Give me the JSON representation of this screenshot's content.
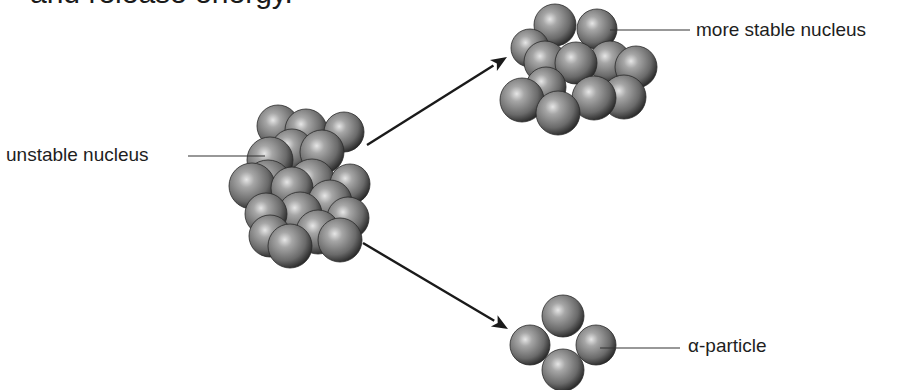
{
  "title": {
    "text": "and release energy.",
    "note": "clipped at top edge"
  },
  "labels": {
    "unstable": "unstable nucleus",
    "stable": "more stable nucleus",
    "alpha": "α-particle"
  },
  "colors": {
    "sphere_light": "#d8d8d8",
    "sphere_mid": "#8a8a8a",
    "sphere_dark": "#2e2e2e",
    "line": "#1a1a1a",
    "text": "#1e1e1e",
    "background": "#ffffff"
  },
  "nuclei": {
    "unstable": {
      "spheres": [
        [
          290,
          246,
          22
        ],
        [
          340,
          240,
          22
        ],
        [
          270,
          236,
          21
        ],
        [
          318,
          232,
          22
        ],
        [
          348,
          218,
          21
        ],
        [
          300,
          214,
          22
        ],
        [
          266,
          214,
          21
        ],
        [
          330,
          202,
          22
        ],
        [
          268,
          184,
          24
        ],
        [
          350,
          184,
          20
        ],
        [
          292,
          188,
          21
        ],
        [
          252,
          186,
          23
        ],
        [
          312,
          182,
          23
        ],
        [
          278,
          126,
          21
        ],
        [
          344,
          132,
          20
        ],
        [
          306,
          130,
          21
        ],
        [
          270,
          160,
          23
        ],
        [
          322,
          152,
          22
        ],
        [
          292,
          150,
          21
        ]
      ]
    },
    "stable": {
      "spheres": [
        [
          558,
          113,
          22
        ],
        [
          522,
          100,
          22
        ],
        [
          594,
          98,
          22
        ],
        [
          624,
          97,
          22
        ],
        [
          546,
          87,
          20
        ],
        [
          636,
          67,
          21
        ],
        [
          610,
          62,
          21
        ],
        [
          576,
          63,
          21
        ],
        [
          545,
          62,
          21
        ],
        [
          530,
          48,
          19
        ],
        [
          555,
          25,
          21
        ],
        [
          597,
          29,
          20
        ]
      ]
    },
    "alpha": {
      "spheres": [
        [
          563,
          316,
          21
        ],
        [
          530,
          345,
          20
        ],
        [
          596,
          345,
          20
        ],
        [
          563,
          370,
          21
        ]
      ]
    }
  },
  "arrows": [
    {
      "from": [
        367,
        145
      ],
      "to": [
        507,
        57
      ]
    },
    {
      "from": [
        363,
        243
      ],
      "to": [
        508,
        329
      ]
    }
  ],
  "leaders": [
    {
      "from": [
        188,
        156
      ],
      "to": [
        265,
        156
      ]
    },
    {
      "from": [
        610,
        30
      ],
      "to": [
        690,
        30
      ]
    },
    {
      "from": [
        600,
        348
      ],
      "to": [
        680,
        348
      ]
    }
  ]
}
